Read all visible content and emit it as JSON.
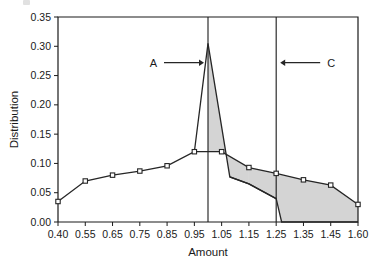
{
  "figure": {
    "background": "#ffffff",
    "line_color": "#262626",
    "marker_face": "#ffffff",
    "marker_edge": "#262626",
    "shade_color": "#d4d4d4",
    "frame_color": "#1a1a1a"
  },
  "chart_data": {
    "type": "line",
    "title": "",
    "subtitle": "",
    "xlabel": "Amount",
    "ylabel": "Distribution",
    "grid": false,
    "legend": null,
    "xlim": [
      0.4,
      1.6
    ],
    "ylim": [
      0.0,
      0.35
    ],
    "xticks": [
      0.4,
      0.55,
      0.65,
      0.75,
      0.85,
      0.95,
      1.05,
      1.15,
      1.25,
      1.35,
      1.45,
      1.6
    ],
    "xtick_labels": [
      "0.40",
      "0.55",
      "0.65",
      "0.75",
      "0.85",
      "0.95",
      "1.05",
      "1.15",
      "1.25",
      "1.35",
      "1.45",
      "1.60"
    ],
    "yticks": [
      0.0,
      0.05,
      0.1,
      0.15,
      0.2,
      0.25,
      0.3,
      0.35
    ],
    "ytick_labels": [
      "0.00",
      "0.05",
      "0.10",
      "0.15",
      "0.20",
      "0.25",
      "0.30",
      "0.35"
    ],
    "series": [
      {
        "name": "upper distribution",
        "marker": "square",
        "x": [
          0.4,
          0.55,
          0.65,
          0.75,
          0.85,
          0.95,
          1.05,
          1.15,
          1.25,
          1.35,
          1.45,
          1.6
        ],
        "values": [
          0.035,
          0.07,
          0.08,
          0.087,
          0.096,
          0.12,
          0.12,
          0.093,
          0.083,
          0.072,
          0.063,
          0.03
        ]
      },
      {
        "name": "peak spike",
        "marker": "none",
        "x": [
          0.95,
          1.0,
          1.08,
          1.15,
          1.25
        ],
        "values": [
          0.12,
          0.305,
          0.077,
          0.065,
          0.04
        ]
      },
      {
        "name": "lower boundary",
        "marker": "none",
        "x": [
          1.08,
          1.15,
          1.25,
          1.27,
          1.6
        ],
        "values": [
          0.077,
          0.065,
          0.04,
          0.0,
          0.0
        ]
      }
    ],
    "vlines": [
      {
        "name": "line-A",
        "x": 1.0,
        "y_from": 0.0,
        "y_to": 0.35
      },
      {
        "name": "line-C",
        "x": 1.25,
        "y_from": 0.0,
        "y_to": 0.35
      }
    ],
    "shaded_regions": [
      {
        "name": "region-A",
        "description": "area under peak spike between x=1.00 and x=1.15"
      },
      {
        "name": "region-C",
        "description": "area under curve right of x=1.25 down to baseline"
      }
    ],
    "annotations": [
      {
        "name": "annotation-a",
        "label": "A",
        "arrow": "right",
        "x": 1.0,
        "y": 0.272
      },
      {
        "name": "annotation-c",
        "label": "C",
        "arrow": "left",
        "x": 1.25,
        "y": 0.272
      }
    ]
  }
}
